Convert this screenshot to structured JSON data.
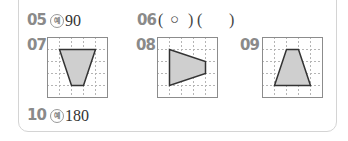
{
  "items": {
    "q05": {
      "number": "05",
      "example_mark": "예",
      "answer": "90"
    },
    "q06": {
      "number": "06",
      "open1": "(",
      "mark1": "○",
      "close1": ")",
      "open2": "(",
      "mark2": "",
      "close2": ")"
    },
    "q07": {
      "number": "07",
      "figure": "inverted trapezoid on 5x5 grid"
    },
    "q08": {
      "number": "08",
      "figure": "trapezoid pointing right on 5x5 grid"
    },
    "q09": {
      "number": "09",
      "figure": "upright trapezoid on 5x5 grid"
    },
    "q10": {
      "number": "10",
      "example_mark": "예",
      "answer": "180"
    }
  },
  "colors": {
    "number_gray": "#8a8a8a",
    "grid_border": "#8c8c8c",
    "grid_dash": "#b5b5b5",
    "shape_fill": "#cfcfcf",
    "shape_stroke": "#333333",
    "card_border": "#d4d4d4"
  }
}
